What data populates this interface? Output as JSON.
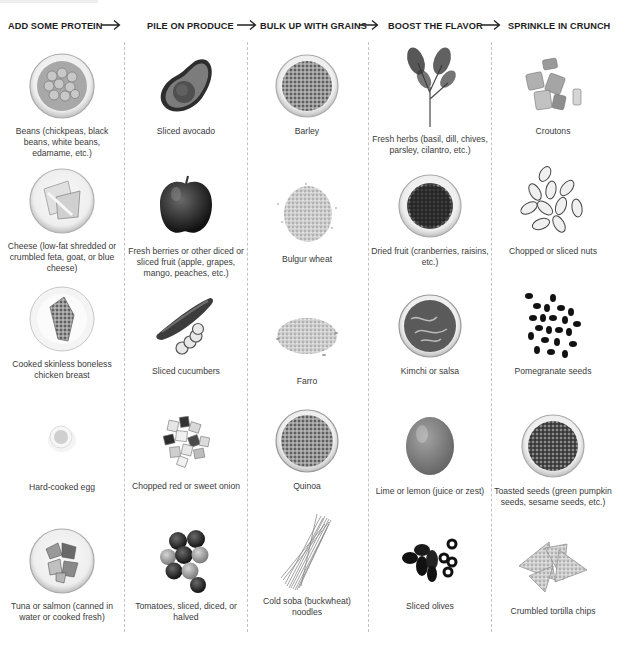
{
  "header": {
    "steps": [
      {
        "label": "ADD SOME PROTEIN"
      },
      {
        "label": "PILE ON PRODUCE"
      },
      {
        "label": "BULK UP WITH GRAINS"
      },
      {
        "label": "BOOST THE FLAVOR"
      },
      {
        "label": "SPRINKLE IN CRUNCH"
      }
    ],
    "arrow_icon": "long-right-arrow"
  },
  "columns": [
    {
      "name": "protein",
      "items": [
        {
          "icon": "bowl-of-chickpeas",
          "caption": "Beans (chickpeas, black beans, white beans, edamame, etc.)"
        },
        {
          "icon": "bowl-of-cheese",
          "caption": "Cheese (low-fat shredded or crumbled feta, goat, or blue cheese)"
        },
        {
          "icon": "plate-of-chicken",
          "caption": "Cooked skinless boneless chicken breast"
        },
        {
          "icon": "hard-cooked-egg",
          "caption": "Hard-cooked egg"
        },
        {
          "icon": "bowl-of-tuna",
          "caption": "Tuna or salmon (canned in water or cooked fresh)"
        }
      ]
    },
    {
      "name": "produce",
      "items": [
        {
          "icon": "avocado-half",
          "caption": "Sliced avocado"
        },
        {
          "icon": "apple",
          "caption": "Fresh berries or other diced or sliced fruit (apple, grapes, mango, peaches, etc.)"
        },
        {
          "icon": "cucumber",
          "caption": "Sliced cucumbers"
        },
        {
          "icon": "chopped-onion",
          "caption": "Chopped red or sweet onion"
        },
        {
          "icon": "tomatoes",
          "caption": "Tomatoes, sliced, diced, or halved"
        }
      ]
    },
    {
      "name": "grains",
      "items": [
        {
          "icon": "bowl-of-barley",
          "caption": "Barley"
        },
        {
          "icon": "bulgur-pile",
          "caption": "Bulgur wheat"
        },
        {
          "icon": "farro-pile",
          "caption": "Farro"
        },
        {
          "icon": "bowl-of-quinoa",
          "caption": "Quinoa"
        },
        {
          "icon": "soba-noodles",
          "caption": "Cold soba (buckwheat) noodles"
        }
      ]
    },
    {
      "name": "flavor",
      "items": [
        {
          "icon": "herb-sprig",
          "caption": "Fresh herbs (basil, dill, chives, parsley, cilantro, etc.)"
        },
        {
          "icon": "bowl-of-dried-fruit",
          "caption": "Dried fruit (cranberries, raisins, etc.)"
        },
        {
          "icon": "jar-of-kimchi",
          "caption": "Kimchi or salsa"
        },
        {
          "icon": "lime",
          "caption": "Lime or lemon (juice or zest)"
        },
        {
          "icon": "olives",
          "caption": "Sliced olives"
        }
      ]
    },
    {
      "name": "crunch",
      "items": [
        {
          "icon": "croutons",
          "caption": "Croutons"
        },
        {
          "icon": "sliced-nuts",
          "caption": "Chopped or sliced nuts"
        },
        {
          "icon": "pomegranate-seeds",
          "caption": "Pomegranate seeds"
        },
        {
          "icon": "bowl-of-seeds",
          "caption": "Toasted seeds (green pumpkin seeds, sesame seeds, etc.)"
        },
        {
          "icon": "tortilla-chips",
          "caption": "Crumbled tortilla chips"
        }
      ]
    }
  ]
}
